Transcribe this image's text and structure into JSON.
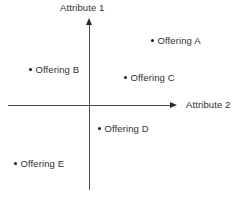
{
  "chart_data": {
    "type": "scatter",
    "title": "",
    "xlabel": "Attribute 2",
    "ylabel": "Attribute 1",
    "xlim": [
      -100,
      100
    ],
    "ylim": [
      -100,
      100
    ],
    "grid": false,
    "legend": "none",
    "axes_style": "crosshair-arrows",
    "origin_px": {
      "x": 89,
      "y": 105
    },
    "points": [
      {
        "label": "Offering A",
        "x": 46,
        "y": 58,
        "px": 152,
        "py": 41,
        "quadrant": "upper-right"
      },
      {
        "label": "Offering B",
        "x": -43,
        "y": 30,
        "px": 30,
        "py": 70,
        "quadrant": "upper-left"
      },
      {
        "label": "Offering C",
        "x": 26,
        "y": 20,
        "px": 125,
        "py": 78,
        "quadrant": "upper-right"
      },
      {
        "label": "Offering D",
        "x": 8,
        "y": -21,
        "px": 99,
        "py": 129,
        "quadrant": "lower-right"
      },
      {
        "label": "Offering E",
        "x": -55,
        "y": -48,
        "px": 15,
        "py": 164,
        "quadrant": "lower-left"
      }
    ]
  },
  "axes": {
    "vertical_label": "Attribute 1",
    "horizontal_label": "Attribute 2"
  },
  "colors": {
    "axis": "#4a4a4a",
    "arrow": "#2b2b2b",
    "text": "#2f2f2f",
    "dot": "#1a1a1a",
    "background": "#ffffff"
  }
}
